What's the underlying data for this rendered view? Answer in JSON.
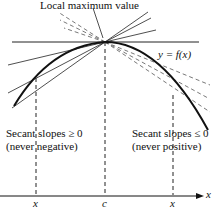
{
  "title_label": "Local maximum value",
  "curve_label": "y = f(x)",
  "left_label": {
    "line1": "Secant slopes ≥ 0",
    "line2": "(never negative)"
  },
  "right_label": {
    "line1": "Secant slopes ≤ 0",
    "line2": "(never positive)"
  },
  "axis": {
    "x_label": "x",
    "ticks": [
      "x",
      "c",
      "x"
    ]
  }
}
